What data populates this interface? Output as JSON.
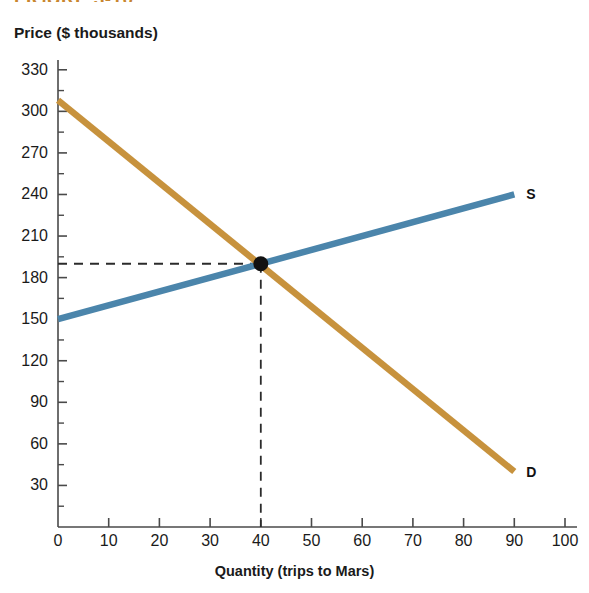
{
  "figure": {
    "heading": "FIGURE 3-10",
    "y_axis_title": "Price ($ thousands)",
    "x_axis_title": "Quantity (trips to Mars)"
  },
  "chart_data": {
    "type": "line",
    "title": "",
    "xlabel": "Quantity (trips to Mars)",
    "ylabel": "Price ($ thousands)",
    "xlim": [
      0,
      100
    ],
    "ylim": [
      0,
      345
    ],
    "xticks": [
      0,
      10,
      20,
      30,
      40,
      50,
      60,
      70,
      80,
      90,
      100
    ],
    "yticks": [
      30,
      60,
      90,
      120,
      150,
      180,
      210,
      240,
      270,
      300,
      330
    ],
    "minor_ticks": true,
    "grid": false,
    "legend_position": "inline-endpoint",
    "series": [
      {
        "name": "Supply",
        "label": "S",
        "color": "#4b85ab",
        "x": [
          0,
          90
        ],
        "values": [
          150,
          240
        ]
      },
      {
        "name": "Demand",
        "label": "D",
        "color": "#c7923d",
        "x": [
          0,
          90
        ],
        "values": [
          308,
          40
        ]
      }
    ],
    "annotations": [
      {
        "name": "equilibrium",
        "type": "point",
        "x": 40,
        "y": 190,
        "marker": "filled-circle",
        "color": "#111111",
        "guide_lines": [
          "horizontal-to-y-axis",
          "vertical-to-x-axis"
        ],
        "guide_style": "dashed"
      }
    ]
  },
  "labels": {
    "supply_curve": "S",
    "demand_curve": "D"
  }
}
